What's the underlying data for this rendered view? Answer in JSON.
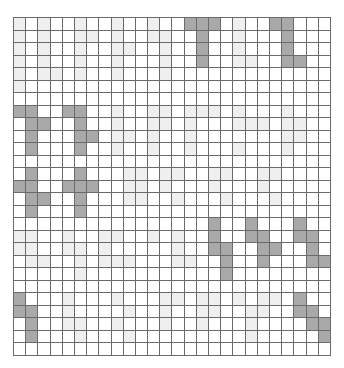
{
  "board": {
    "name": "cellular-automaton-grid",
    "cols": 26,
    "rows": 27,
    "colors": {
      "alive": "#a9a9a9",
      "ghost": "#efefef",
      "empty": "#ffffff",
      "grid_line": "#6a6a6a"
    },
    "alive_cells": [
      [
        0,
        14
      ],
      [
        0,
        15
      ],
      [
        0,
        16
      ],
      [
        0,
        21
      ],
      [
        0,
        22
      ],
      [
        1,
        15
      ],
      [
        1,
        22
      ],
      [
        2,
        15
      ],
      [
        2,
        22
      ],
      [
        3,
        15
      ],
      [
        3,
        22
      ],
      [
        3,
        23
      ],
      [
        7,
        0
      ],
      [
        7,
        1
      ],
      [
        7,
        4
      ],
      [
        7,
        5
      ],
      [
        8,
        1
      ],
      [
        8,
        2
      ],
      [
        8,
        5
      ],
      [
        9,
        1
      ],
      [
        9,
        5
      ],
      [
        9,
        6
      ],
      [
        10,
        1
      ],
      [
        10,
        5
      ],
      [
        12,
        1
      ],
      [
        12,
        5
      ],
      [
        13,
        0
      ],
      [
        13,
        1
      ],
      [
        13,
        4
      ],
      [
        13,
        5
      ],
      [
        13,
        6
      ],
      [
        14,
        1
      ],
      [
        14,
        2
      ],
      [
        14,
        5
      ],
      [
        15,
        1
      ],
      [
        15,
        5
      ],
      [
        16,
        16
      ],
      [
        16,
        19
      ],
      [
        16,
        23
      ],
      [
        17,
        16
      ],
      [
        17,
        19
      ],
      [
        17,
        20
      ],
      [
        17,
        23
      ],
      [
        17,
        24
      ],
      [
        18,
        16
      ],
      [
        18,
        17
      ],
      [
        18,
        20
      ],
      [
        18,
        21
      ],
      [
        18,
        24
      ],
      [
        19,
        17
      ],
      [
        19,
        20
      ],
      [
        19,
        24
      ],
      [
        19,
        25
      ],
      [
        20,
        17
      ],
      [
        22,
        0
      ],
      [
        22,
        23
      ],
      [
        23,
        0
      ],
      [
        23,
        1
      ],
      [
        23,
        23
      ],
      [
        23,
        24
      ],
      [
        24,
        1
      ],
      [
        24,
        24
      ],
      [
        24,
        25
      ],
      [
        25,
        1
      ],
      [
        25,
        25
      ]
    ],
    "ghost_cells": [
      [
        0,
        0
      ],
      [
        0,
        2
      ],
      [
        0,
        5
      ],
      [
        0,
        8
      ],
      [
        0,
        11
      ],
      [
        0,
        18
      ],
      [
        1,
        0
      ],
      [
        1,
        2
      ],
      [
        1,
        5
      ],
      [
        1,
        6
      ],
      [
        1,
        8
      ],
      [
        1,
        11
      ],
      [
        1,
        12
      ],
      [
        1,
        18
      ],
      [
        2,
        0
      ],
      [
        2,
        2
      ],
      [
        2,
        5
      ],
      [
        2,
        8
      ],
      [
        2,
        9
      ],
      [
        2,
        12
      ],
      [
        2,
        18
      ],
      [
        3,
        0
      ],
      [
        3,
        2
      ],
      [
        3,
        5
      ],
      [
        3,
        8
      ],
      [
        3,
        12
      ],
      [
        3,
        18
      ],
      [
        3,
        19
      ],
      [
        4,
        0
      ],
      [
        4,
        2
      ],
      [
        4,
        3
      ],
      [
        4,
        5
      ],
      [
        4,
        8
      ],
      [
        4,
        12
      ],
      [
        5,
        0
      ],
      [
        7,
        8
      ],
      [
        7,
        11
      ],
      [
        7,
        12
      ],
      [
        7,
        14
      ],
      [
        7,
        15
      ],
      [
        7,
        16
      ],
      [
        7,
        18
      ],
      [
        7,
        22
      ],
      [
        8,
        8
      ],
      [
        8,
        11
      ],
      [
        8,
        12
      ],
      [
        8,
        14
      ],
      [
        8,
        18
      ],
      [
        8,
        19
      ],
      [
        8,
        20
      ],
      [
        8,
        22
      ],
      [
        8,
        23
      ],
      [
        9,
        8
      ],
      [
        9,
        9
      ],
      [
        9,
        11
      ],
      [
        9,
        14
      ],
      [
        9,
        22
      ],
      [
        9,
        23
      ],
      [
        10,
        8
      ],
      [
        10,
        11
      ],
      [
        10,
        14
      ],
      [
        10,
        18
      ],
      [
        10,
        22
      ],
      [
        12,
        9
      ],
      [
        12,
        10
      ],
      [
        12,
        12
      ],
      [
        12,
        13
      ],
      [
        12,
        16
      ],
      [
        12,
        17
      ],
      [
        12,
        20
      ],
      [
        12,
        21
      ],
      [
        13,
        9
      ],
      [
        13,
        10
      ],
      [
        13,
        12
      ],
      [
        13,
        16
      ],
      [
        13,
        20
      ],
      [
        14,
        9
      ],
      [
        14,
        10
      ],
      [
        14,
        13
      ],
      [
        14,
        17
      ],
      [
        14,
        21
      ],
      [
        17,
        0
      ],
      [
        17,
        1
      ],
      [
        17,
        4
      ],
      [
        17,
        7
      ],
      [
        17,
        8
      ],
      [
        17,
        11
      ],
      [
        17,
        13
      ],
      [
        18,
        0
      ],
      [
        18,
        1
      ],
      [
        18,
        4
      ],
      [
        18,
        5
      ],
      [
        18,
        7
      ],
      [
        18,
        13
      ],
      [
        19,
        1
      ],
      [
        19,
        2
      ],
      [
        19,
        5
      ],
      [
        19,
        7
      ],
      [
        19,
        8
      ],
      [
        19,
        9
      ],
      [
        19,
        13
      ],
      [
        19,
        14
      ],
      [
        20,
        5
      ],
      [
        22,
        4
      ],
      [
        22,
        8
      ],
      [
        22,
        12
      ],
      [
        22,
        13
      ],
      [
        22,
        15
      ],
      [
        22,
        16
      ],
      [
        22,
        18
      ],
      [
        22,
        20
      ],
      [
        22,
        21
      ],
      [
        23,
        4
      ],
      [
        23,
        9
      ],
      [
        23,
        12
      ],
      [
        23,
        15
      ],
      [
        23,
        16
      ],
      [
        23,
        19
      ],
      [
        23,
        20
      ],
      [
        24,
        4
      ],
      [
        24,
        5
      ],
      [
        24,
        8
      ],
      [
        24,
        12
      ],
      [
        24,
        15
      ],
      [
        24,
        19
      ],
      [
        25,
        5
      ],
      [
        25,
        9
      ],
      [
        25,
        19
      ]
    ]
  }
}
